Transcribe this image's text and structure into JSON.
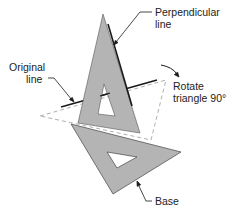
{
  "labels": {
    "perpendicular_line_1": "Perpendicular",
    "perpendicular_line_2": "line",
    "original_line_1": "Original",
    "original_line_2": "line",
    "rotate_1": "Rotate",
    "rotate_2": "triangle 90°",
    "base": "Base"
  },
  "colors": {
    "triangle_fill": "#b4b4b4",
    "triangle_stroke": "#444444",
    "line": "#1a1a1a",
    "dashed": "#999999",
    "text": "#222222"
  }
}
